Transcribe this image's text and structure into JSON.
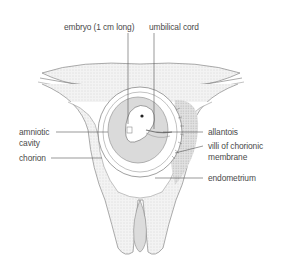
{
  "diagram": {
    "labels": {
      "embryo": "embryo (1 cm long)",
      "umbilical_cord": "umbilical cord",
      "amniotic_cavity_line1": "amniotic",
      "amniotic_cavity_line2": "cavity",
      "chorion": "chorion",
      "allantois": "allantois",
      "villi_line1": "villi of chorionic",
      "villi_line2": "membrane",
      "endometrium": "endometrium"
    },
    "colors": {
      "outline": "#777777",
      "tissue_fill": "#ececec",
      "cavity_fill": "#dadada",
      "leader": "#555555",
      "text": "#4a4a4a"
    }
  }
}
